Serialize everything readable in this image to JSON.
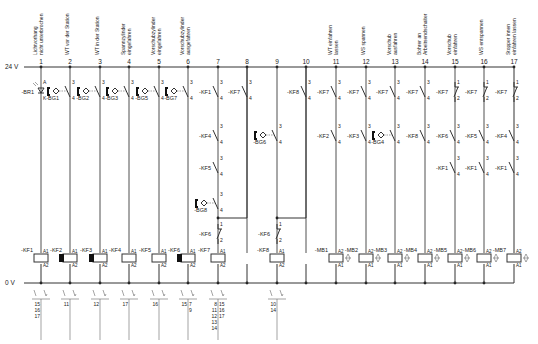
{
  "rails": {
    "top_label": "24 V",
    "bottom_label": "0 V"
  },
  "columns": [
    {
      "num": "1",
      "x": 41,
      "label": [
        "Lichtvorhang",
        "nicht unterbrochen"
      ]
    },
    {
      "num": "2",
      "x": 70,
      "label": [
        "WT vor der Station"
      ]
    },
    {
      "num": "3",
      "x": 100,
      "label": [
        "WT in der Station"
      ]
    },
    {
      "num": "4",
      "x": 129,
      "label": [
        "Spannzylinder",
        "eingefahren"
      ]
    },
    {
      "num": "5",
      "x": 159,
      "label": [
        "Vorschubzylinder",
        "eingefahren"
      ]
    },
    {
      "num": "6",
      "x": 188,
      "label": [
        "Vorschubzylinder",
        "ausgefahren"
      ]
    },
    {
      "num": "7",
      "x": 218,
      "label": []
    },
    {
      "num": "8",
      "x": 247,
      "label": []
    },
    {
      "num": "9",
      "x": 277,
      "label": []
    },
    {
      "num": "10",
      "x": 306,
      "label": []
    },
    {
      "num": "11",
      "x": 336,
      "label": [
        "WT einfahren",
        "lassen"
      ]
    },
    {
      "num": "12",
      "x": 366,
      "label": [
        "WS spannen"
      ]
    },
    {
      "num": "13",
      "x": 395,
      "label": [
        "Vorschub",
        "ausfahren"
      ]
    },
    {
      "num": "14",
      "x": 425,
      "label": [
        "Bohrer an",
        "Arbeitsendschalter"
      ]
    },
    {
      "num": "15",
      "x": 455,
      "label": [
        "Vorschub",
        "einfahren"
      ]
    },
    {
      "num": "16",
      "x": 484,
      "label": [
        "WS entspannen"
      ]
    },
    {
      "num": "17",
      "x": 514,
      "label": [
        "Stopper innen",
        "einfahren lassen"
      ]
    }
  ],
  "row1": [
    {
      "col": 0,
      "tag": "-BR1",
      "type": "sensor-light",
      "t": [
        "A",
        "K"
      ]
    },
    {
      "col": 1,
      "tag": "-BG1",
      "type": "prox-no",
      "t": [
        "3",
        "4"
      ]
    },
    {
      "col": 2,
      "tag": "-BG2",
      "type": "prox-no",
      "t": [
        "3",
        "4"
      ]
    },
    {
      "col": 3,
      "tag": "-BG3",
      "type": "prox-no",
      "t": [
        "3",
        "4"
      ]
    },
    {
      "col": 4,
      "tag": "-BG5",
      "type": "prox-no",
      "t": [
        "3",
        "4"
      ]
    },
    {
      "col": 5,
      "tag": "-BG7",
      "type": "prox-no",
      "t": [
        "3",
        "4"
      ]
    },
    {
      "col": 6,
      "tag": "-KF1",
      "type": "no",
      "t": [
        "3",
        "4"
      ]
    },
    {
      "col": 7,
      "tag": "-KF7",
      "type": "no",
      "t": [
        "3",
        "4"
      ]
    },
    {
      "col": 9,
      "tag": "-KF8",
      "type": "no",
      "t": [
        "3",
        "4"
      ]
    },
    {
      "col": 10,
      "tag": "-KF7",
      "type": "no",
      "t": [
        "3",
        "4"
      ]
    },
    {
      "col": 11,
      "tag": "-KF7",
      "type": "no",
      "t": [
        "3",
        "4"
      ]
    },
    {
      "col": 12,
      "tag": "-KF7",
      "type": "no",
      "t": [
        "3",
        "4"
      ]
    },
    {
      "col": 13,
      "tag": "-KF7",
      "type": "no",
      "t": [
        "3",
        "4"
      ]
    },
    {
      "col": 14,
      "tag": "-KF7",
      "type": "nc",
      "t": [
        "1",
        "2"
      ]
    },
    {
      "col": 15,
      "tag": "-KF7",
      "type": "nc",
      "t": [
        "1",
        "2"
      ]
    },
    {
      "col": 16,
      "tag": "-KF7",
      "type": "nc",
      "t": [
        "1",
        "2"
      ]
    }
  ],
  "row2": [
    {
      "col": 6,
      "tag": "-KF4",
      "type": "no",
      "t": [
        "3",
        "4"
      ]
    },
    {
      "col": 8,
      "tag": "-BG6",
      "type": "prox-no",
      "t": [
        "3",
        "4"
      ]
    },
    {
      "col": 10,
      "tag": "-KF2",
      "type": "no",
      "t": [
        "3",
        "4"
      ]
    },
    {
      "col": 11,
      "tag": "-KF3",
      "type": "no",
      "t": [
        "3",
        "4"
      ]
    },
    {
      "col": 12,
      "tag": "-BG4",
      "type": "prox-no",
      "t": [
        "3",
        "4"
      ]
    },
    {
      "col": 13,
      "tag": "-KF8",
      "type": "no",
      "t": [
        "3",
        "4"
      ]
    },
    {
      "col": 14,
      "tag": "-KF6",
      "type": "no",
      "t": [
        "3",
        "4"
      ]
    },
    {
      "col": 15,
      "tag": "-KF5",
      "type": "no",
      "t": [
        "3",
        "4"
      ]
    },
    {
      "col": 16,
      "tag": "-KF4",
      "type": "no",
      "t": [
        "3",
        "4"
      ]
    }
  ],
  "row3": [
    {
      "col": 6,
      "tag": "-KF5",
      "type": "no",
      "t": [
        "3",
        "4"
      ]
    },
    {
      "col": 14,
      "tag": "-KF1",
      "type": "no",
      "t": [
        "3",
        "4"
      ]
    },
    {
      "col": 15,
      "tag": "-KF1",
      "type": "no",
      "t": [
        "3",
        "4"
      ]
    },
    {
      "col": 16,
      "tag": "-KF1",
      "type": "no",
      "t": [
        "3",
        "4"
      ]
    }
  ],
  "row4": [
    {
      "col": 6,
      "tag": "-BG8",
      "type": "prox-no",
      "t": [
        "3",
        "4"
      ]
    }
  ],
  "latch": [
    {
      "col": 6,
      "tag": "-KF6",
      "type": "nc",
      "t": [
        "1",
        "2"
      ]
    },
    {
      "col": 8,
      "tag": "-KF6",
      "type": "nc",
      "t": [
        "1",
        "2"
      ]
    }
  ],
  "coils": [
    {
      "col": 0,
      "tag": "-KF1",
      "kind": "relay",
      "filled": false,
      "refs": [
        "15",
        "16",
        "17"
      ]
    },
    {
      "col": 1,
      "tag": "-KF2",
      "kind": "relay",
      "filled": true,
      "refs": [
        "11"
      ]
    },
    {
      "col": 2,
      "tag": "-KF3",
      "kind": "relay",
      "filled": true,
      "refs": [
        "12"
      ]
    },
    {
      "col": 3,
      "tag": "-KF4",
      "kind": "relay",
      "filled": false,
      "refs": [
        "17"
      ]
    },
    {
      "col": 4,
      "tag": "-KF5",
      "kind": "relay",
      "filled": false,
      "refs": [
        "16"
      ]
    },
    {
      "col": 5,
      "tag": "-KF6",
      "kind": "relay",
      "filled": true,
      "refs": [
        "15",
        "7",
        "9"
      ]
    },
    {
      "col": 6,
      "tag": "-KF7",
      "kind": "relay",
      "filled": false,
      "refs": [
        "8",
        "11",
        "12",
        "13",
        "14",
        "15",
        "16",
        "17"
      ]
    },
    {
      "col": 8,
      "tag": "-KF8",
      "kind": "relay",
      "filled": false,
      "refs": [
        "10",
        "14"
      ]
    },
    {
      "col": 10,
      "tag": "-MB1",
      "kind": "valve"
    },
    {
      "col": 11,
      "tag": "-MB2",
      "kind": "valve"
    },
    {
      "col": 12,
      "tag": "-MB3",
      "kind": "valve"
    },
    {
      "col": 13,
      "tag": "-MB4",
      "kind": "valve"
    },
    {
      "col": 14,
      "tag": "-MB5",
      "kind": "valve"
    },
    {
      "col": 15,
      "tag": "-MB6",
      "kind": "valve"
    },
    {
      "col": 16,
      "tag": "-MB7",
      "kind": "valve"
    }
  ],
  "contact_refs": [
    {
      "col": 0,
      "lines": [
        "15",
        "16",
        "17"
      ]
    },
    {
      "col": 1,
      "lines": [
        "11"
      ]
    },
    {
      "col": 2,
      "lines": [
        "12"
      ]
    },
    {
      "col": 3,
      "lines": [
        "17"
      ]
    },
    {
      "col": 4,
      "lines": [
        "16"
      ]
    },
    {
      "col": 5,
      "left": [
        "15"
      ],
      "right": [
        "7",
        "9"
      ]
    },
    {
      "col": 6,
      "left": [
        "8",
        "11",
        "12",
        "13",
        "14"
      ],
      "right": [
        "15",
        "16",
        "17"
      ]
    },
    {
      "col": 8,
      "lines": [
        "10",
        "14"
      ]
    }
  ],
  "coil_terminals": {
    "a1": "A1",
    "a2": "A2"
  }
}
